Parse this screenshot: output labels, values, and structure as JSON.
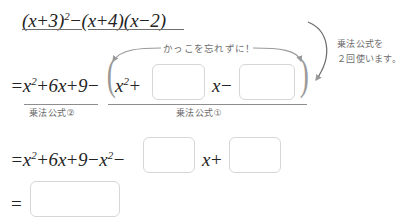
{
  "problem": {
    "expression_parts": [
      {
        "text": "(x+3)",
        "sup": "2"
      },
      {
        "text": "−"
      },
      {
        "text": "(x+4)(x−2)"
      }
    ],
    "full_text": "(x+3)²−(x+4)(x−2)"
  },
  "lines": {
    "line2": {
      "lhs": "=x",
      "lhs_sup": "2",
      "lhs_rest": "+6x+9−",
      "inner_start": "x",
      "inner_start_sup": "2",
      "inner_plus": "+",
      "inner_middle": "x−",
      "open_paren": "(",
      "close_paren": ")"
    },
    "line3": {
      "lhs": "=x",
      "lhs_sup": "2",
      "lhs_rest": "+6x+9−x",
      "lhs_sup2": "2",
      "lhs_tail": "−",
      "middle": "x+"
    },
    "line4": {
      "equals": "="
    }
  },
  "labels": {
    "formula_two": "乗法公式②",
    "formula_one": "乗法公式①",
    "paren_reminder": "かっこを忘れずに！",
    "side_note_line1": "乗法公式を",
    "side_note_line2": "２回使います。"
  },
  "blanks": {
    "line2_box1": "",
    "line2_box2": "",
    "line3_box1": "",
    "line3_box2": "",
    "line4_box1": ""
  },
  "colors": {
    "ink": "#232323",
    "rule": "#8d8d8d",
    "box_border": "#d6d6d6",
    "annotation": "#6d6d6d",
    "arrow": "#9a9a9a",
    "background": "#ffffff"
  }
}
